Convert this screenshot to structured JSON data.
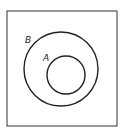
{
  "diagram": {
    "type": "venn",
    "universe": {
      "x": 7,
      "y": 11,
      "width": 110,
      "height": 115
    },
    "sets": [
      {
        "name": "B",
        "label": "B",
        "cx": 61,
        "cy": 69,
        "r": 37,
        "label_x": 25,
        "label_y": 43
      },
      {
        "name": "A",
        "label": "A",
        "cx": 66,
        "cy": 75,
        "r": 19,
        "label_x": 43,
        "label_y": 61
      }
    ],
    "colors": {
      "stroke": "#222222",
      "background": "#ffffff"
    }
  }
}
